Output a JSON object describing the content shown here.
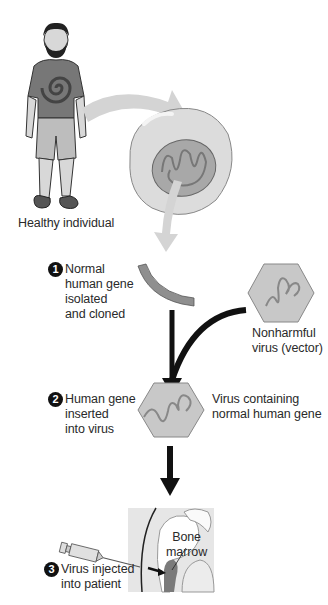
{
  "diagram": {
    "colors": {
      "arrow_light": "#d4d4d4",
      "arrow_dark": "#111111",
      "cell": "#d9d9d9",
      "nucleus": "#a8a8a8",
      "gene": "#8f8f8f",
      "virus": "#c8c8c8",
      "marrow": "#7a7a7a"
    },
    "labels": {
      "healthy": "Healthy individual",
      "step1_num": "1",
      "step1_lines": [
        "Normal",
        "human gene",
        "isolated",
        "and cloned"
      ],
      "vector_lines": [
        "Nonharmful",
        "virus (vector)"
      ],
      "step2_num": "2",
      "step2_lines": [
        "Human gene",
        "inserted",
        "into virus"
      ],
      "virus_gene_lines": [
        "Virus containing",
        "normal human gene"
      ],
      "marrow_lines": [
        "Bone",
        "marrow"
      ],
      "step3_num": "3",
      "step3_lines": [
        "Virus injected",
        "into patient"
      ]
    }
  }
}
